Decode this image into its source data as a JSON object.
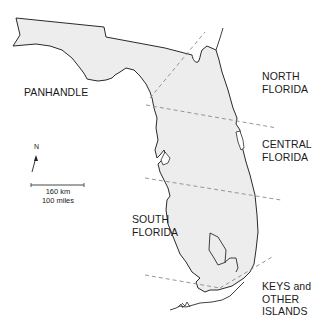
{
  "map": {
    "subject": "Florida",
    "land_fill": "#ededed",
    "outline_color": "#2a2a2a",
    "divider_color": "#8a8a8a",
    "background": "#ffffff"
  },
  "regions": [
    {
      "id": "panhandle",
      "label": "PANHANDLE"
    },
    {
      "id": "north",
      "label": "NORTH\nFLORIDA"
    },
    {
      "id": "central",
      "label": "CENTRAL\nFLORIDA"
    },
    {
      "id": "south",
      "label": "SOUTH\nFLORIDA"
    },
    {
      "id": "keys",
      "label": "KEYS and\nOTHER\nISLANDS"
    }
  ],
  "compass": {
    "label": "N"
  },
  "scale_bar": {
    "label": "160 km\n100 miles"
  }
}
